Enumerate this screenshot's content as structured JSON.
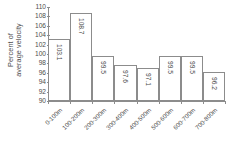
{
  "chart_data": {
    "type": "bar",
    "title": "",
    "subtitle": "",
    "xlabel": "",
    "ylabel": "Percent of average velocity",
    "ylabel_line1": "Percent of",
    "ylabel_line2": "average velocity",
    "categories": [
      "0-100m",
      "100-200m",
      "200-300m",
      "300-400m",
      "400-500m",
      "500-600m",
      "600-700m",
      "700-800m"
    ],
    "values": [
      103.1,
      108.7,
      99.5,
      97.6,
      97.1,
      99.5,
      99.5,
      96.2
    ],
    "value_labels": [
      "103.1",
      "108.7",
      "99.5",
      "97.6",
      "97.1",
      "99.5",
      "99.5",
      "96.2"
    ],
    "ylim": [
      90,
      110
    ],
    "ytick_step": 2,
    "yticks": [
      110,
      108,
      106,
      104,
      102,
      100,
      98,
      96,
      94,
      92,
      90
    ],
    "ytick_labels": [
      "110",
      "108",
      "106",
      "104",
      "102",
      "100",
      "98",
      "96",
      "94",
      "92",
      "90"
    ],
    "grid": false,
    "legend": false,
    "legend_position": "none",
    "bar_fill_color": "#ffffff",
    "bar_border_color": "#8c8c8c",
    "axis_color": "#8c8c8c",
    "text_color": "#4d4d4d"
  }
}
